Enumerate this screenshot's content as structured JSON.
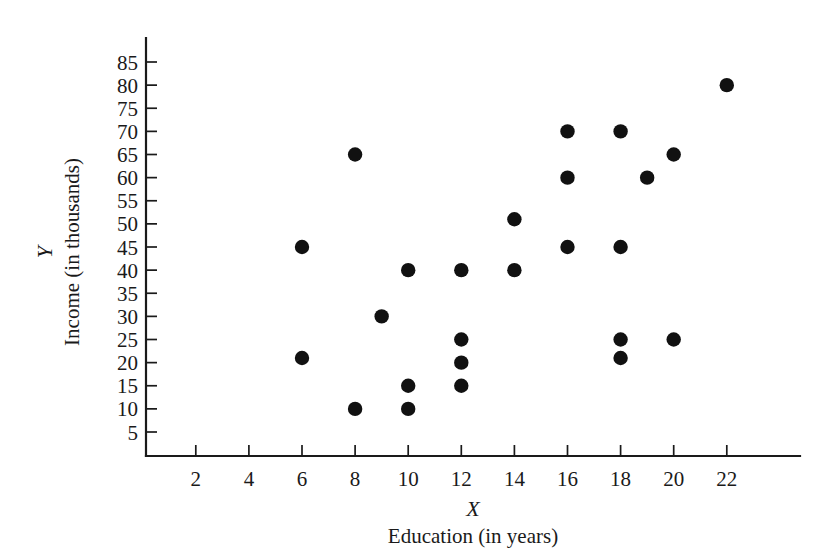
{
  "chart_data": {
    "type": "scatter",
    "title": "",
    "xlabel": "Education (in years)",
    "ylabel": "Income (in thousands)",
    "x_variable_symbol": "X",
    "y_variable_symbol": "Y",
    "xlim": [
      0,
      23.5
    ],
    "ylim": [
      0,
      90
    ],
    "grid": false,
    "legend": null,
    "x_ticks": [
      2,
      4,
      6,
      8,
      10,
      12,
      14,
      16,
      18,
      20,
      22
    ],
    "y_ticks": [
      5,
      10,
      15,
      20,
      25,
      30,
      35,
      40,
      45,
      50,
      55,
      60,
      65,
      70,
      75,
      80,
      85
    ],
    "marker": "filled-circle",
    "marker_color": "#111111",
    "points": [
      {
        "x": 6,
        "y": 45
      },
      {
        "x": 6,
        "y": 21
      },
      {
        "x": 8,
        "y": 65
      },
      {
        "x": 8,
        "y": 10
      },
      {
        "x": 9,
        "y": 30
      },
      {
        "x": 10,
        "y": 40
      },
      {
        "x": 10,
        "y": 15
      },
      {
        "x": 10,
        "y": 10
      },
      {
        "x": 12,
        "y": 40
      },
      {
        "x": 12,
        "y": 25
      },
      {
        "x": 12,
        "y": 20
      },
      {
        "x": 12,
        "y": 15
      },
      {
        "x": 14,
        "y": 51
      },
      {
        "x": 14,
        "y": 40
      },
      {
        "x": 16,
        "y": 70
      },
      {
        "x": 16,
        "y": 60
      },
      {
        "x": 16,
        "y": 45
      },
      {
        "x": 18,
        "y": 70
      },
      {
        "x": 18,
        "y": 45
      },
      {
        "x": 18,
        "y": 25
      },
      {
        "x": 18,
        "y": 21
      },
      {
        "x": 19,
        "y": 60
      },
      {
        "x": 20,
        "y": 65
      },
      {
        "x": 20,
        "y": 25
      },
      {
        "x": 22,
        "y": 80
      }
    ]
  },
  "axes": {
    "x_label_primary": "X",
    "x_label_secondary": "Education (in years)",
    "y_label_primary": "Y",
    "y_label_secondary": "Income (in thousands)"
  }
}
